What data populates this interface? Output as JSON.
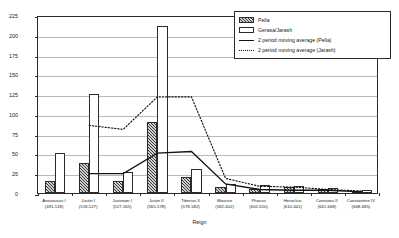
{
  "chart_data": {
    "type": "bar",
    "title": "",
    "xlabel": "Reign",
    "ylabel": "Averaged Annual Value (in nomismata)",
    "ylim": [
      0,
      225
    ],
    "yticks": [
      0,
      25,
      50,
      75,
      100,
      125,
      150,
      175,
      200,
      225
    ],
    "grid": true,
    "legend_position": "top-right",
    "categories": [
      "Anastasius I",
      "Justin I",
      "Justinian I",
      "Justin II",
      "Tiberius II",
      "Maurice",
      "Phocas",
      "Heraclius",
      "Constans II",
      "Constantine IV"
    ],
    "category_years": [
      "(491-518)",
      "(518-527)",
      "(527-565)",
      "(565-578)",
      "(578-582)",
      "(582-602)",
      "(602-610)",
      "(610-641)",
      "(641-668)",
      "(668-685)"
    ],
    "series": [
      {
        "name": "Pella",
        "style": "bar-hatched",
        "values": [
          15,
          38,
          15,
          90,
          20,
          8,
          5,
          7,
          5,
          3
        ]
      },
      {
        "name": "Gerasa/Jarash",
        "style": "bar-open",
        "values": [
          50,
          125,
          27,
          211,
          30,
          12,
          10,
          9,
          6,
          4
        ]
      },
      {
        "name": "2 period moving average (Pella)",
        "style": "line-solid",
        "values": [
          null,
          27,
          27,
          53,
          55,
          14,
          7,
          6,
          6,
          4
        ]
      },
      {
        "name": "2 period moving average (Jarash)",
        "style": "line-dotted",
        "values": [
          null,
          88,
          83,
          124,
          124,
          21,
          11,
          10,
          7,
          5
        ]
      }
    ]
  },
  "legend": {
    "entries": [
      {
        "label": "Pella",
        "swatch": "bar-hatched"
      },
      {
        "label": "Gerasa/Jarash",
        "swatch": "bar-open"
      },
      {
        "label": "2 period moving average (Pella)",
        "swatch": "line-solid"
      },
      {
        "label": "2 period moving average (Jarash)",
        "swatch": "line-dotted"
      }
    ]
  },
  "axes": {
    "y_title": "Averaged Annual Value (in nomismata)",
    "x_title": "Reign"
  }
}
